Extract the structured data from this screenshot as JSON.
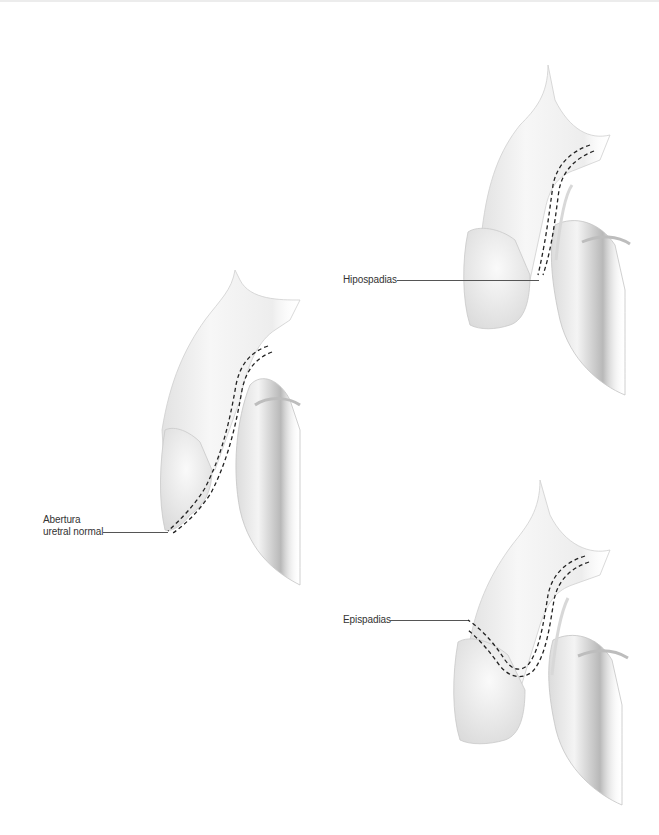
{
  "diagram": {
    "type": "anatomical-illustration",
    "panels": [
      {
        "id": "normal",
        "label_lines": [
          "Abertura",
          "uretral normal"
        ],
        "description": "Normal urethral opening at tip of glans"
      },
      {
        "id": "hypospadias",
        "label_lines": [
          "Hipospadias"
        ],
        "description": "Urethral opening on underside of penis"
      },
      {
        "id": "epispadias",
        "label_lines": [
          "Epispadias"
        ],
        "description": "Urethral opening on upper side of penis"
      }
    ],
    "colors": {
      "background": "#ffffff",
      "organ_fill": "#f2f2f2",
      "organ_shade": "#c8c8c8",
      "urethra_dash": "#222222",
      "leader_line": "#555555",
      "label_text": "#333333"
    }
  }
}
